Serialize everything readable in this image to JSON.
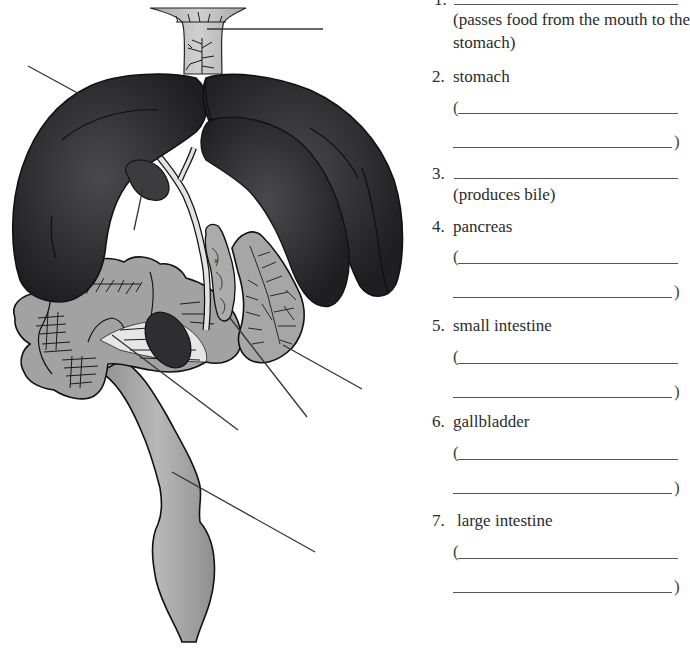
{
  "diagram": {
    "organs": [
      {
        "id": "esophagus",
        "shade": "#bdbdbd"
      },
      {
        "id": "liver",
        "shade": "#2b2b2d"
      },
      {
        "id": "gallbladder",
        "shade": "#3a3a3c"
      },
      {
        "id": "pancreas",
        "shade": "#a9a9a9"
      },
      {
        "id": "stomach",
        "shade": "#a4a4a4"
      },
      {
        "id": "small_intestine",
        "shade": "#a0a0a0"
      },
      {
        "id": "spleen",
        "shade": "#2e2e30"
      },
      {
        "id": "large_intestine",
        "shade": "#9d9d9d"
      }
    ],
    "leader_lines": [
      {
        "target": "esophagus",
        "x1": 207,
        "y1": 29,
        "x2": 323,
        "y2": 29
      },
      {
        "target": "liver",
        "x1": 28,
        "y1": 66,
        "x2": 96,
        "y2": 103
      },
      {
        "target": "gallbladder",
        "x1": 143,
        "y1": 188,
        "x2": 134,
        "y2": 230
      },
      {
        "target": "small_intestine",
        "x1": 112,
        "y1": 335,
        "x2": 238,
        "y2": 430
      },
      {
        "target": "pancreas",
        "x1": 230,
        "y1": 318,
        "x2": 307,
        "y2": 417
      },
      {
        "target": "stomach",
        "x1": 283,
        "y1": 345,
        "x2": 362,
        "y2": 389
      },
      {
        "target": "large_intestine",
        "x1": 172,
        "y1": 472,
        "x2": 315,
        "y2": 552
      }
    ]
  },
  "worksheet": {
    "items": [
      {
        "number": "1.",
        "name": "",
        "hint_line1": "(passes food from the mouth to the",
        "hint_line2": "stomach)"
      },
      {
        "number": "2.",
        "name": "stomach",
        "open_paren": "(",
        "close_paren": ")"
      },
      {
        "number": "3.",
        "name": "",
        "hint_line1": "(produces bile)"
      },
      {
        "number": "4.",
        "name": "pancreas",
        "open_paren": "(",
        "close_paren": ")"
      },
      {
        "number": "5.",
        "name": "small intestine",
        "open_paren": "(",
        "close_paren": ")"
      },
      {
        "number": "6.",
        "name": "gallbladder",
        "open_paren": "(",
        "close_paren": ")"
      },
      {
        "number": "7.",
        "name": "large intestine",
        "open_paren": "(",
        "close_paren": ")"
      }
    ]
  }
}
